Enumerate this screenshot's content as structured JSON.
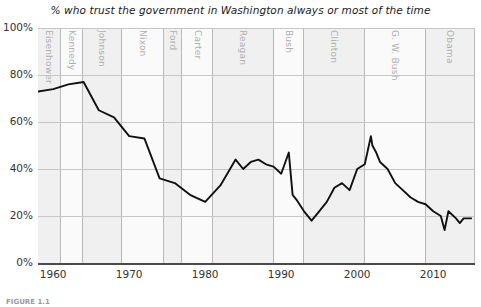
{
  "figure": {
    "title": "% who trust the government in Washington always or most of the time",
    "caption": "FIGURE 1.1"
  },
  "axes": {
    "y_ticks": [
      "0%",
      "20%",
      "40%",
      "60%",
      "80%",
      "100%"
    ],
    "y_values": [
      0,
      20,
      40,
      60,
      80,
      100
    ],
    "x_ticks": [
      "1960",
      "1970",
      "1980",
      "1990",
      "2000",
      "2010"
    ],
    "x_values": [
      1960,
      1970,
      1980,
      1990,
      2000,
      2010
    ]
  },
  "presidents": [
    {
      "label": "Eisenhower",
      "start": 1958,
      "end": 1961,
      "shade": "shade"
    },
    {
      "label": "Kennedy",
      "start": 1961,
      "end": 1963.9,
      "shade": "plain"
    },
    {
      "label": "Johnson",
      "start": 1963.9,
      "end": 1969,
      "shade": "shade"
    },
    {
      "label": "Nixon",
      "start": 1969,
      "end": 1974.6,
      "shade": "plain"
    },
    {
      "label": "Ford",
      "start": 1974.6,
      "end": 1977,
      "shade": "shade"
    },
    {
      "label": "Carter",
      "start": 1977,
      "end": 1981,
      "shade": "plain"
    },
    {
      "label": "Reagan",
      "start": 1981,
      "end": 1989,
      "shade": "shade"
    },
    {
      "label": "Bush",
      "start": 1989,
      "end": 1993,
      "shade": "plain"
    },
    {
      "label": "Clinton",
      "start": 1993,
      "end": 2001,
      "shade": "shade"
    },
    {
      "label": "G. W. Bush",
      "start": 2001,
      "end": 2009,
      "shade": "plain"
    },
    {
      "label": "Obama",
      "start": 2009,
      "end": 2015.5,
      "shade": "shade"
    }
  ],
  "chart_data": {
    "type": "line",
    "title": "% who trust the government in Washington always or most of the time",
    "xlabel": "",
    "ylabel": "",
    "xlim": [
      1958,
      2015.5
    ],
    "ylim": [
      0,
      100
    ],
    "grid": true,
    "legend": false,
    "line_color": "#111111",
    "x": [
      1958,
      1960,
      1962,
      1964,
      1966,
      1968,
      1970,
      1972,
      1974,
      1976,
      1978,
      1980,
      1982,
      1984,
      1985,
      1986,
      1987,
      1988,
      1989,
      1990,
      1991,
      1991.5,
      1992,
      1993,
      1994,
      1995,
      1996,
      1997,
      1998,
      1999,
      2000,
      2001,
      2001.8,
      2002,
      2002.5,
      2003,
      2004,
      2005,
      2006,
      2007,
      2008,
      2009,
      2010,
      2011,
      2011.5,
      2012,
      2013,
      2013.5,
      2014,
      2015
    ],
    "y": [
      73,
      74,
      76,
      77,
      65,
      62,
      54,
      53,
      36,
      34,
      29,
      26,
      33,
      44,
      40,
      43,
      44,
      42,
      41,
      38,
      47,
      29,
      27,
      22,
      18,
      22,
      26,
      32,
      34,
      31,
      40,
      42,
      54,
      50,
      47,
      43,
      40,
      34,
      31,
      28,
      26,
      25,
      22,
      20,
      14,
      22,
      19,
      17,
      19,
      19
    ],
    "annotations": [
      {
        "text": "peak trust mid-1960s",
        "x": 1964,
        "y": 77
      },
      {
        "text": "post-Watergate decline",
        "x": 1980,
        "y": 26
      },
      {
        "text": "Gulf War spike",
        "x": 1991,
        "y": 47
      },
      {
        "text": "post-9/11 peak",
        "x": 2002,
        "y": 54
      }
    ]
  }
}
